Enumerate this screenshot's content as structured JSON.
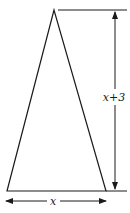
{
  "figure": {
    "shape": "isosceles-triangle",
    "base_label": "x",
    "height_label": "x+3",
    "height_label_parts": {
      "variable": "x",
      "operator": "+",
      "constant": "3"
    },
    "dimensions": [
      {
        "name": "base",
        "expression": "x",
        "orientation": "horizontal"
      },
      {
        "name": "height",
        "expression": "x+3",
        "orientation": "vertical"
      }
    ],
    "colors": {
      "line": "#1a1a1a",
      "background": "#ffffff"
    }
  }
}
